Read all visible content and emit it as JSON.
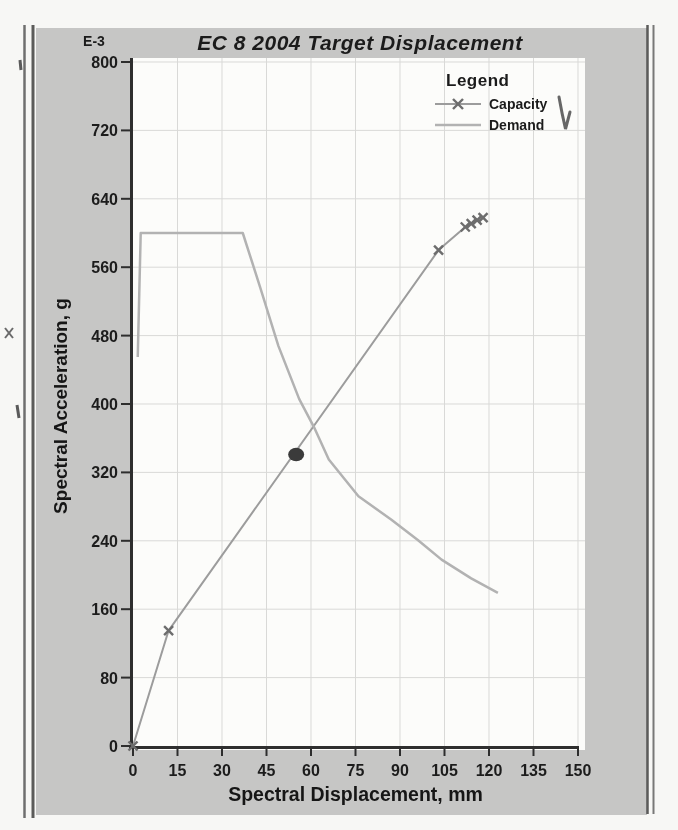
{
  "window": {
    "page_bg": "#f7f7f5",
    "panel_bg": "#c6c6c5",
    "plot_bg": "#fcfcfa"
  },
  "chart_data": {
    "type": "line",
    "title": "EC 8 2004 Target Displacement",
    "unit_label": "E-3",
    "xlabel": "Spectral Displacement, mm",
    "ylabel": "Spectral Acceleration, g",
    "xlim": [
      0,
      150
    ],
    "ylim": [
      0,
      800
    ],
    "x_ticks": [
      0,
      15,
      30,
      45,
      60,
      75,
      90,
      105,
      120,
      135,
      150
    ],
    "y_ticks": [
      0,
      80,
      160,
      240,
      320,
      400,
      480,
      560,
      640,
      720,
      800
    ],
    "grid": true,
    "legend": {
      "title": "Legend",
      "position": "top-right",
      "entries": [
        {
          "label": "Capacity",
          "marker": "x"
        },
        {
          "label": "Demand",
          "marker": "none"
        }
      ]
    },
    "colors": {
      "grid": "#d9d9d7",
      "axis": "#2e2e2e",
      "text": "#1c1c1c",
      "capacity_line": "#9c9c9c",
      "capacity_marker": "#6d6d6d",
      "demand_line": "#b2b2b2",
      "target_point": "#3b3b3b"
    },
    "series": [
      {
        "name": "Capacity",
        "marker": "x",
        "color": "#9c9c9c",
        "marker_color": "#6d6d6d",
        "width": 2,
        "points": [
          [
            0,
            0
          ],
          [
            12,
            135
          ],
          [
            103,
            580
          ],
          [
            112,
            607
          ],
          [
            114,
            611
          ],
          [
            116,
            615
          ],
          [
            118,
            618
          ]
        ]
      },
      {
        "name": "Demand",
        "marker": "none",
        "color": "#b2b2b2",
        "width": 2.5,
        "points": [
          [
            1.6,
            455
          ],
          [
            2.6,
            600
          ],
          [
            37,
            600
          ],
          [
            43,
            535
          ],
          [
            49,
            468
          ],
          [
            56,
            406
          ],
          [
            61,
            373
          ],
          [
            66,
            335
          ],
          [
            76,
            292
          ],
          [
            87,
            265
          ],
          [
            96,
            241
          ],
          [
            104,
            218
          ],
          [
            114,
            196
          ],
          [
            123,
            179
          ]
        ]
      }
    ],
    "annotations": [
      {
        "type": "point",
        "name": "target-displacement-point",
        "x": 55,
        "y": 341,
        "color": "#3b3b3b"
      }
    ]
  }
}
